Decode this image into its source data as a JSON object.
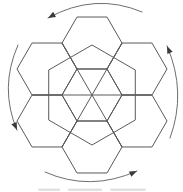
{
  "figure": {
    "name": "hexagon-rotation-diagram",
    "canvas": {
      "width": 183,
      "height": 191
    },
    "colors": {
      "background": "#ffffff",
      "hex_stroke": "#5a5a5a",
      "arc_stroke": "#6e6e6e",
      "arrowhead_fill": "#3a3a3a",
      "caption_remnant": "#c8c8c8"
    },
    "stroke_width": 1,
    "hex_radius": 30,
    "center": [
      92,
      95
    ],
    "central_hexagon": {
      "center": [
        92,
        95
      ],
      "radius": 30,
      "orientation": "flat-top"
    },
    "ring_hexagons": {
      "orientation": "flat-top",
      "radius": 30,
      "centers": [
        [
          92,
          43
        ],
        [
          137,
          69
        ],
        [
          137,
          121
        ],
        [
          92,
          147
        ],
        [
          47,
          121
        ],
        [
          47,
          69
        ]
      ]
    },
    "big_hexagon": {
      "center": [
        92,
        95
      ],
      "radius": 50,
      "orientation": "pointy-top"
    },
    "spoke_lines": [
      [
        [
          32,
          95
        ],
        [
          152,
          95
        ]
      ],
      [
        [
          62,
          43
        ],
        [
          122,
          147
        ]
      ],
      [
        [
          122,
          43
        ],
        [
          62,
          147
        ]
      ]
    ],
    "rotation_direction": "counterclockwise",
    "rotation_arrows": [
      {
        "name": "top-arrow",
        "from": [
          142,
          12
        ],
        "ctrl": [
          95,
          -8
        ],
        "to": [
          48,
          18
        ]
      },
      {
        "name": "left-arrow",
        "from": [
          18,
          45
        ],
        "ctrl": [
          -1,
          88
        ],
        "to": [
          17,
          130
        ]
      },
      {
        "name": "bottom-arrow",
        "from": [
          45,
          172
        ],
        "ctrl": [
          90,
          192
        ],
        "to": [
          137,
          171
        ]
      },
      {
        "name": "right-arrow",
        "from": [
          170,
          138
        ],
        "ctrl": [
          187,
          92
        ],
        "to": [
          167,
          46
        ]
      }
    ],
    "arrowhead": {
      "length": 7.5,
      "half_width": 2.9
    },
    "caption_remnant_marks": [
      [
        38,
        188.5,
        22,
        2.5
      ],
      [
        68,
        188.5,
        34,
        2.5
      ],
      [
        110,
        188.5,
        36,
        2.5
      ]
    ]
  }
}
